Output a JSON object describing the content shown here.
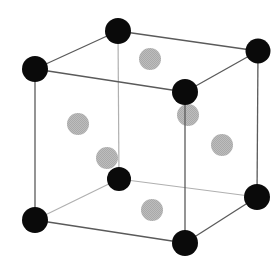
{
  "diagram": {
    "type": "fcc-unit-cell",
    "colors": {
      "background": "#ffffff",
      "corner_atom": "#0a0a0a",
      "face_atom": "#b4b4b4",
      "front_edge": "#5a5a5a",
      "back_edge": "#b0b0b0"
    },
    "corner_atoms": [
      {
        "id": "top-back-left",
        "x": 118,
        "y": 31,
        "r": 13
      },
      {
        "id": "top-back-right",
        "x": 258,
        "y": 51,
        "r": 12.5
      },
      {
        "id": "top-front-left",
        "x": 35,
        "y": 69,
        "r": 13
      },
      {
        "id": "top-front-right",
        "x": 185,
        "y": 92,
        "r": 13
      },
      {
        "id": "bottom-back-left",
        "x": 119,
        "y": 179,
        "r": 12
      },
      {
        "id": "bottom-back-right",
        "x": 257,
        "y": 197,
        "r": 13
      },
      {
        "id": "bottom-front-left",
        "x": 35,
        "y": 220,
        "r": 13
      },
      {
        "id": "bottom-front-right",
        "x": 185,
        "y": 243,
        "r": 13
      }
    ],
    "face_atoms": [
      {
        "id": "top-face",
        "x": 150,
        "y": 59,
        "r": 11
      },
      {
        "id": "back-face",
        "x": 188,
        "y": 115,
        "r": 11
      },
      {
        "id": "left-face",
        "x": 78,
        "y": 124,
        "r": 11
      },
      {
        "id": "right-face",
        "x": 222,
        "y": 145,
        "r": 11
      },
      {
        "id": "front-hidden-face",
        "x": 107,
        "y": 158,
        "r": 11
      },
      {
        "id": "bottom-face",
        "x": 152,
        "y": 210,
        "r": 11
      }
    ],
    "back_edges": [
      {
        "from": "top-back-left",
        "to": "bottom-back-left"
      },
      {
        "from": "bottom-back-left",
        "to": "bottom-front-left"
      },
      {
        "from": "bottom-back-left",
        "to": "bottom-back-right"
      }
    ],
    "front_edges": [
      {
        "from": "top-back-left",
        "to": "top-back-right"
      },
      {
        "from": "top-back-left",
        "to": "top-front-left"
      },
      {
        "from": "top-front-left",
        "to": "top-front-right"
      },
      {
        "from": "top-back-right",
        "to": "top-front-right"
      },
      {
        "from": "top-front-left",
        "to": "bottom-front-left"
      },
      {
        "from": "top-front-right",
        "to": "bottom-front-right"
      },
      {
        "from": "top-back-right",
        "to": "bottom-back-right"
      },
      {
        "from": "bottom-front-left",
        "to": "bottom-front-right"
      },
      {
        "from": "bottom-back-right",
        "to": "bottom-front-right"
      }
    ]
  }
}
